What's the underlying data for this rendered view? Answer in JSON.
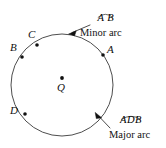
{
  "figure": {
    "type": "circle-arc-diagram",
    "width": 166,
    "height": 148,
    "stroke_color": "#3a3a3a",
    "text_color": "#111111",
    "circle": {
      "cx": 62,
      "cy": 85,
      "r": 51
    },
    "center": {
      "label": "Q",
      "dot": {
        "x": 62,
        "y": 78
      },
      "label_pos": {
        "x": 58,
        "y": 84
      }
    },
    "points": [
      {
        "label": "A",
        "dot": {
          "x": 103,
          "y": 55
        },
        "label_pos": {
          "x": 107,
          "y": 49
        }
      },
      {
        "label": "B",
        "dot": {
          "x": 22,
          "y": 57
        },
        "label_pos": {
          "x": 11,
          "y": 47
        }
      },
      {
        "label": "C",
        "dot": {
          "x": 37,
          "y": 45
        },
        "label_pos": {
          "x": 28,
          "y": 33
        }
      },
      {
        "label": "D",
        "dot": {
          "x": 25,
          "y": 114
        },
        "label_pos": {
          "x": 12,
          "y": 110
        }
      }
    ],
    "callouts": [
      {
        "id": "minor-arc",
        "arc_name": "A B",
        "caption": "Minor arc",
        "arc_name_pos": {
          "x": 103,
          "y": 4
        },
        "caption_pos": {
          "x": 92,
          "y": 19
        },
        "leader": {
          "x1": 90,
          "y1": 25,
          "x2": 70,
          "y2": 33
        },
        "arrow_at": {
          "x": 69,
          "y": 34
        }
      },
      {
        "id": "major-arc",
        "arc_name": "ADB",
        "caption": "Major arc",
        "arc_name_pos": {
          "x": 115,
          "y": 107
        },
        "caption_pos": {
          "x": 110,
          "y": 123
        },
        "leader": {
          "x1": 108,
          "y1": 128,
          "x2": 96,
          "y2": 114
        },
        "arrow_at": {
          "x": 95,
          "y": 113
        }
      }
    ]
  }
}
